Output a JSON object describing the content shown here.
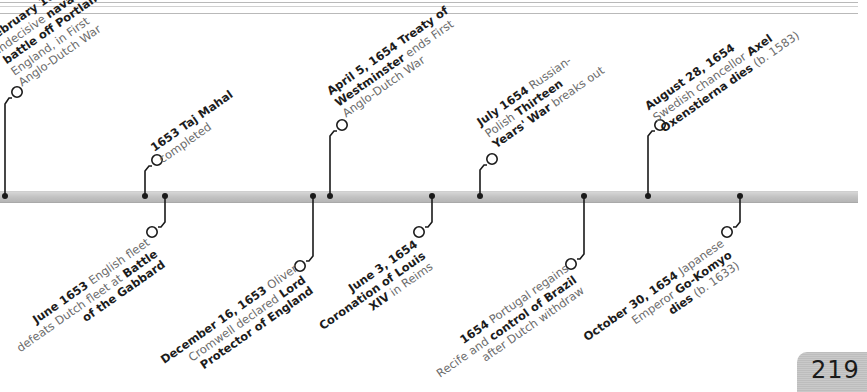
{
  "page_number": "219",
  "events": [
    {
      "id": "feb-1653",
      "side": "up",
      "date": "February 1653",
      "lines": [
        [
          {
            "t": "February 1653",
            "b": true
          }
        ],
        [
          {
            "t": "Indecisive ",
            "b": false
          },
          {
            "t": "naval",
            "b": true
          }
        ],
        [
          {
            "t": "battle off Portland",
            "b": true
          },
          {
            "t": ",",
            "b": false
          }
        ],
        [
          {
            "t": "England, in First",
            "b": false
          }
        ],
        [
          {
            "t": "Anglo-Dutch War",
            "b": false
          }
        ]
      ]
    },
    {
      "id": "1653-taj",
      "side": "up",
      "date": "1653",
      "lines": [
        [
          {
            "t": "1653 ",
            "b": true
          },
          {
            "t": "Taj Mahal",
            "b": true
          }
        ],
        [
          {
            "t": "completed",
            "b": false
          }
        ]
      ]
    },
    {
      "id": "june-1653",
      "side": "down",
      "date": "June 1653",
      "lines": [
        [
          {
            "t": "June 1653",
            "b": true
          },
          {
            "t": " English fleet",
            "b": false
          }
        ],
        [
          {
            "t": "defeats Dutch fleet at ",
            "b": false
          },
          {
            "t": "Battle",
            "b": true
          }
        ],
        [
          {
            "t": "of the Gabbard",
            "b": true
          }
        ]
      ]
    },
    {
      "id": "dec-1653",
      "side": "down",
      "date": "December 16, 1653",
      "lines": [
        [
          {
            "t": "December 16, 1653",
            "b": true
          },
          {
            "t": " Oliver",
            "b": false
          }
        ],
        [
          {
            "t": "Cromwell declared ",
            "b": false
          },
          {
            "t": "Lord",
            "b": true
          }
        ],
        [
          {
            "t": "Protector of England",
            "b": true
          }
        ]
      ]
    },
    {
      "id": "apr-1654",
      "side": "up",
      "date": "April 5, 1654",
      "lines": [
        [
          {
            "t": "April 5, 1654",
            "b": true
          },
          {
            "t": " Treaty of",
            "b": true
          }
        ],
        [
          {
            "t": "Westminster",
            "b": true
          },
          {
            "t": " ends First",
            "b": false
          }
        ],
        [
          {
            "t": "Anglo-Dutch War",
            "b": false
          }
        ]
      ]
    },
    {
      "id": "jun-1654",
      "side": "down",
      "date": "June 3, 1654",
      "lines": [
        [
          {
            "t": "June 3, 1654",
            "b": true
          }
        ],
        [
          {
            "t": "Coronation of Louis",
            "b": true
          }
        ],
        [
          {
            "t": "XIV",
            "b": true
          },
          {
            "t": " in Reims",
            "b": false
          }
        ]
      ]
    },
    {
      "id": "jul-1654",
      "side": "up",
      "date": "July 1654",
      "lines": [
        [
          {
            "t": "July 1654",
            "b": true
          },
          {
            "t": " Russian-",
            "b": false
          }
        ],
        [
          {
            "t": "Polish ",
            "b": false
          },
          {
            "t": "Thirteen",
            "b": true
          }
        ],
        [
          {
            "t": "Years' War",
            "b": true
          },
          {
            "t": " breaks out",
            "b": false
          }
        ]
      ]
    },
    {
      "id": "1654-portugal",
      "side": "down",
      "date": "1654",
      "lines": [
        [
          {
            "t": "1654",
            "b": true
          },
          {
            "t": " Portugal regains",
            "b": false
          }
        ],
        [
          {
            "t": "Recife and ",
            "b": false
          },
          {
            "t": "control of Brazil",
            "b": true
          }
        ],
        [
          {
            "t": "after Dutch withdraw",
            "b": false
          }
        ]
      ]
    },
    {
      "id": "aug-1654",
      "side": "up",
      "date": "August 28, 1654",
      "lines": [
        [
          {
            "t": "August 28, 1654",
            "b": true
          }
        ],
        [
          {
            "t": "Swedish chancellor ",
            "b": false
          },
          {
            "t": "Axel",
            "b": true
          }
        ],
        [
          {
            "t": "Oxenstierna dies",
            "b": true
          },
          {
            "t": " (b. 1583)",
            "b": false
          }
        ]
      ]
    },
    {
      "id": "oct-1654",
      "side": "down",
      "date": "October 30, 1654",
      "lines": [
        [
          {
            "t": "October 30, 1654",
            "b": true
          },
          {
            "t": " Japanese",
            "b": false
          }
        ],
        [
          {
            "t": "Emperor ",
            "b": false
          },
          {
            "t": "Go-Komyo",
            "b": true
          }
        ],
        [
          {
            "t": "dies",
            "b": true
          },
          {
            "t": " (b. 1633)",
            "b": false
          }
        ]
      ]
    }
  ],
  "colors": {
    "bold_text": "#1c1c1c",
    "regular_text": "#6b6b6b",
    "connector": "#1a1a1a",
    "bar": "#c2c2c2"
  }
}
